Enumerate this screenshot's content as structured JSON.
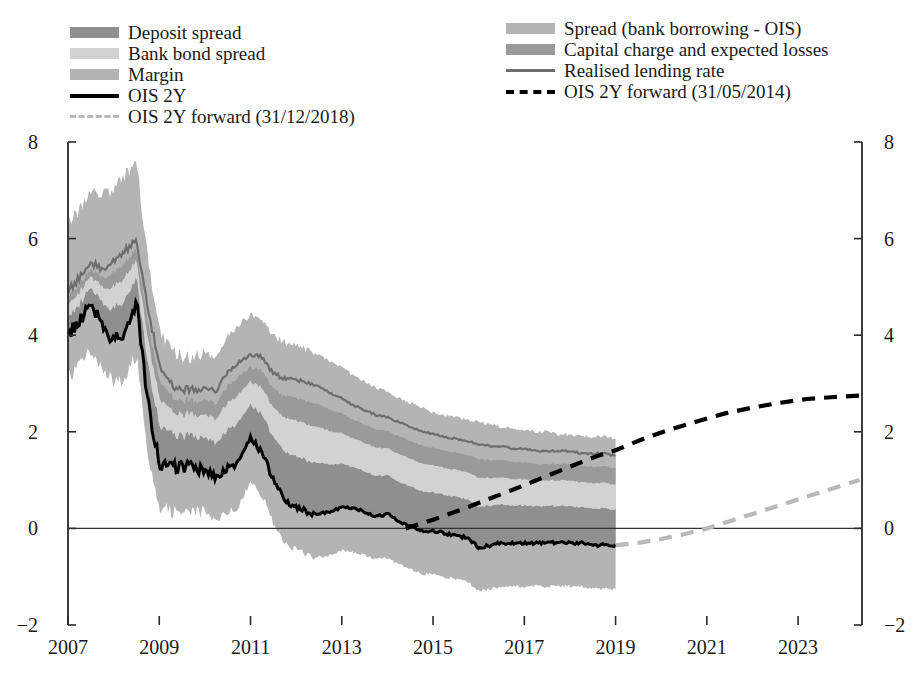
{
  "legend": {
    "left_column": [
      {
        "label": "Deposit spread",
        "marker": "swatch",
        "color": "#8f8f8f"
      },
      {
        "label": "Bank bond spread",
        "marker": "swatch",
        "color": "#d2d2d2"
      },
      {
        "label": "Margin",
        "marker": "swatch",
        "color": "#b4b4b4"
      },
      {
        "label": "OIS 2Y",
        "marker": "line",
        "color": "#000000"
      },
      {
        "label": "OIS 2Y forward (31/12/2018)",
        "marker": "dash",
        "color": "#b9b9b9"
      }
    ],
    "right_column": [
      {
        "label": "Spread (bank borrowing - OIS)",
        "marker": "swatch",
        "color": "#b4b4b4"
      },
      {
        "label": "Capital charge and expected losses",
        "marker": "swatch",
        "color": "#9a9a9a"
      },
      {
        "label": "Realised lending rate",
        "marker": "line",
        "color": "#6e6e6e"
      },
      {
        "label": "OIS 2Y forward (31/05/2014)",
        "marker": "dash",
        "color": "#000000"
      }
    ]
  },
  "chart_data": {
    "type": "area",
    "title": "",
    "xlabel": "",
    "ylabel": "",
    "xlim": [
      2007.0,
      2024.4
    ],
    "ylim": [
      -2,
      8
    ],
    "yticks": [
      8,
      6,
      4,
      2,
      0,
      -2
    ],
    "xticks": [
      2007,
      2009,
      2011,
      2013,
      2015,
      2017,
      2019,
      2021,
      2023
    ],
    "grid": false,
    "legend_position": "top",
    "axis_units": "percent per annum",
    "stacking": "OIS 2Y baseline, bands stacked upward: deposit spread, bank bond spread, capital charge and expected losses, margin; sum equals realised lending rate",
    "colors": {
      "deposit_spread": "#8f8f8f",
      "bank_bond_spread": "#d2d2d2",
      "capital_charge": "#9a9a9a",
      "margin": "#b4b4b4",
      "spread_bank_borrowing_ois": "#b4b4b4",
      "ois_2y": "#000000",
      "realised_lending_rate": "#6e6e6e",
      "forward_2014": "#000000",
      "forward_2018": "#b9b9b9"
    },
    "x": [
      2007.0,
      2007.25,
      2007.5,
      2007.75,
      2008.0,
      2008.25,
      2008.5,
      2008.75,
      2009.0,
      2009.25,
      2009.5,
      2009.75,
      2010.0,
      2010.25,
      2010.5,
      2010.75,
      2011.0,
      2011.25,
      2011.5,
      2011.75,
      2012.0,
      2012.25,
      2012.5,
      2012.75,
      2013.0,
      2013.25,
      2013.5,
      2013.75,
      2014.0,
      2014.25,
      2014.5,
      2014.75,
      2015.0,
      2015.25,
      2015.5,
      2015.75,
      2016.0,
      2016.25,
      2016.5,
      2016.75,
      2017.0,
      2017.25,
      2017.5,
      2017.75,
      2018.0,
      2018.25,
      2018.5,
      2018.75,
      2019.0
    ],
    "series": [
      {
        "name": "OIS 2Y",
        "type": "line",
        "values": [
          4.0,
          4.3,
          4.65,
          4.2,
          3.9,
          4.05,
          4.7,
          2.6,
          1.35,
          1.25,
          1.3,
          1.25,
          1.2,
          1.05,
          1.25,
          1.35,
          1.85,
          1.6,
          1.0,
          0.6,
          0.45,
          0.35,
          0.3,
          0.35,
          0.45,
          0.4,
          0.35,
          0.25,
          0.3,
          0.15,
          0.05,
          -0.05,
          -0.05,
          -0.1,
          -0.15,
          -0.2,
          -0.4,
          -0.35,
          -0.3,
          -0.3,
          -0.3,
          -0.3,
          -0.3,
          -0.3,
          -0.3,
          -0.3,
          -0.35,
          -0.35,
          -0.35
        ]
      },
      {
        "name": "Realised lending rate",
        "type": "line",
        "values": [
          4.9,
          5.2,
          5.5,
          5.4,
          5.5,
          5.75,
          5.95,
          4.6,
          3.35,
          3.0,
          2.85,
          2.9,
          2.9,
          2.85,
          3.25,
          3.45,
          3.6,
          3.55,
          3.2,
          3.1,
          3.1,
          3.0,
          2.95,
          2.8,
          2.7,
          2.55,
          2.45,
          2.35,
          2.3,
          2.2,
          2.1,
          2.0,
          1.95,
          1.9,
          1.85,
          1.8,
          1.75,
          1.7,
          1.7,
          1.65,
          1.65,
          1.6,
          1.6,
          1.6,
          1.6,
          1.55,
          1.55,
          1.55,
          1.5
        ]
      },
      {
        "name": "Upper band (lending rate envelope top)",
        "type": "band_top",
        "values": [
          6.3,
          6.6,
          7.0,
          6.9,
          7.0,
          7.3,
          7.6,
          5.6,
          4.1,
          3.7,
          3.55,
          3.55,
          3.6,
          3.55,
          4.0,
          4.25,
          4.4,
          4.35,
          4.0,
          3.85,
          3.8,
          3.7,
          3.6,
          3.45,
          3.35,
          3.15,
          3.05,
          2.9,
          2.85,
          2.7,
          2.6,
          2.5,
          2.4,
          2.35,
          2.3,
          2.25,
          2.2,
          2.15,
          2.1,
          2.05,
          2.05,
          2.0,
          2.0,
          1.95,
          1.95,
          1.9,
          1.9,
          1.9,
          1.85
        ]
      },
      {
        "name": "Lower band (envelope bottom)",
        "type": "band_bottom",
        "values": [
          3.1,
          3.4,
          3.7,
          3.3,
          3.0,
          3.1,
          3.6,
          1.6,
          0.45,
          0.35,
          0.4,
          0.35,
          0.3,
          0.15,
          0.35,
          0.45,
          0.95,
          0.7,
          0.1,
          -0.3,
          -0.45,
          -0.55,
          -0.6,
          -0.55,
          -0.45,
          -0.5,
          -0.55,
          -0.65,
          -0.6,
          -0.75,
          -0.85,
          -0.95,
          -0.95,
          -1.0,
          -1.05,
          -1.1,
          -1.3,
          -1.25,
          -1.2,
          -1.2,
          -1.2,
          -1.2,
          -1.2,
          -1.2,
          -1.2,
          -1.2,
          -1.25,
          -1.25,
          -1.25
        ]
      }
    ],
    "forward_curves": [
      {
        "name": "OIS 2Y forward (31/05/2014)",
        "style": "dashed",
        "color": "#000000",
        "x": [
          2014.4,
          2015.0,
          2015.6,
          2016.2,
          2016.8,
          2017.4,
          2018.0,
          2018.6,
          2019.0,
          2019.6,
          2020.2,
          2020.8,
          2021.4,
          2022.0,
          2022.6,
          2023.2,
          2023.8,
          2024.35
        ],
        "y": [
          0.0,
          0.18,
          0.38,
          0.6,
          0.82,
          1.05,
          1.28,
          1.5,
          1.62,
          1.85,
          2.05,
          2.22,
          2.38,
          2.5,
          2.6,
          2.68,
          2.72,
          2.75
        ]
      },
      {
        "name": "OIS 2Y forward (31/12/2018)",
        "style": "dashed",
        "color": "#b9b9b9",
        "x": [
          2019.0,
          2019.5,
          2020.0,
          2020.5,
          2021.0,
          2021.5,
          2022.0,
          2022.5,
          2023.0,
          2023.5,
          2024.0,
          2024.35
        ],
        "y": [
          -0.35,
          -0.3,
          -0.22,
          -0.12,
          0.0,
          0.15,
          0.3,
          0.45,
          0.6,
          0.75,
          0.9,
          1.0
        ]
      }
    ]
  },
  "axes": {
    "y_labels": [
      "8",
      "6",
      "4",
      "2",
      "0",
      "-2"
    ],
    "x_labels": [
      "2007",
      "2009",
      "2011",
      "2013",
      "2015",
      "2017",
      "2019",
      "2021",
      "2023"
    ]
  }
}
